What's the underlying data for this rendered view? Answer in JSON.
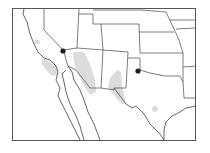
{
  "map": {
    "title": "",
    "description": "Range map of southwestern United States and northern Mexico with stippled distribution areas and two point localities",
    "colors": {
      "background": "#ffffff",
      "lines": "#555555",
      "stipple": "#d8d8d8",
      "marker": "#1e1e1e"
    },
    "regions_shown": [
      "California",
      "Nevada",
      "Utah",
      "Colorado",
      "Arizona",
      "New Mexico",
      "Texas",
      "Oklahoma",
      "Kansas",
      "Nebraska",
      "Wyoming",
      "Baja California",
      "Sonora"
    ],
    "stippled_areas": [
      {
        "name": "central-california-patch"
      },
      {
        "name": "southern-california-coast"
      },
      {
        "name": "western-arizona-band"
      },
      {
        "name": "southern-new-mexico-trans-pecos"
      },
      {
        "name": "central-texas-patch"
      }
    ],
    "point_localities": [
      {
        "name": "nevada-california-border-locality",
        "x": 63,
        "y": 51
      },
      {
        "name": "texas-panhandle-locality",
        "x": 138,
        "y": 71
      }
    ]
  }
}
